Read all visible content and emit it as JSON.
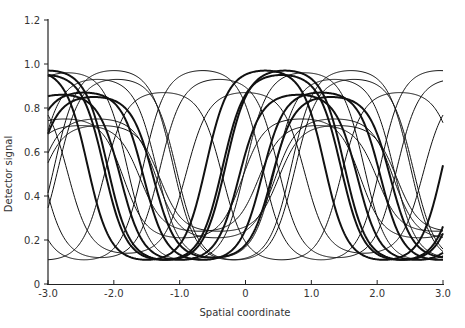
{
  "chart_data": {
    "type": "line",
    "title": "",
    "xlabel": "Spatial coordinate",
    "ylabel": "Detector signal",
    "xlim": [
      -3.0,
      3.0
    ],
    "ylim": [
      0,
      1.2
    ],
    "grid": false,
    "legend": "none",
    "x_ticks": [
      -3.0,
      -2.0,
      -1.0,
      0,
      1.0,
      2.0,
      3.0
    ],
    "x_tick_labels": [
      "-3.0",
      "-2.0",
      "-1.0",
      "0",
      "1.0",
      "2.0",
      "3.0"
    ],
    "y_ticks": [
      0,
      0.2,
      0.4,
      0.6,
      0.8,
      1.0,
      1.2
    ],
    "y_tick_labels": [
      "0",
      "0.2",
      "0.4",
      "0.6",
      "0.8",
      "1.0",
      "1.2"
    ],
    "period": 3.6,
    "series": [
      {
        "name": "curve-1",
        "peak_x": -2.45,
        "max": 0.87,
        "min": 0.11,
        "weight": "thick"
      },
      {
        "name": "curve-2",
        "peak_x": -2.3,
        "max": 0.85,
        "min": 0.12,
        "weight": "thick"
      },
      {
        "name": "curve-3",
        "peak_x": -3.0,
        "max": 0.97,
        "min": 0.11,
        "weight": "thick"
      },
      {
        "name": "curve-4",
        "peak_x": -2.7,
        "max": 0.96,
        "min": 0.11,
        "weight": "thin"
      },
      {
        "name": "curve-5",
        "peak_x": -2.25,
        "max": 0.75,
        "min": 0.21,
        "weight": "thin"
      },
      {
        "name": "curve-6",
        "peak_x": -2.2,
        "max": 0.72,
        "min": 0.24,
        "weight": "thin"
      },
      {
        "name": "curve-7",
        "peak_x": -1.95,
        "max": 0.93,
        "min": 0.11,
        "weight": "thin"
      },
      {
        "name": "curve-8",
        "peak_x": -0.65,
        "max": 0.97,
        "min": 0.11,
        "weight": "thin"
      },
      {
        "name": "curve-9",
        "peak_x": -0.4,
        "max": 0.93,
        "min": 0.12,
        "weight": "thin"
      },
      {
        "name": "curve-10",
        "peak_x": 0.0,
        "max": 0.87,
        "min": 0.14,
        "weight": "thin"
      },
      {
        "name": "curve-11",
        "peak_x": 0.3,
        "max": 0.97,
        "min": 0.11,
        "weight": "thick"
      },
      {
        "name": "curve-12",
        "peak_x": 0.55,
        "max": 0.95,
        "min": 0.11,
        "weight": "thick"
      },
      {
        "name": "curve-13",
        "peak_x": 0.85,
        "max": 0.75,
        "min": 0.21,
        "weight": "thin"
      },
      {
        "name": "curve-14",
        "peak_x": 1.1,
        "max": 0.72,
        "min": 0.24,
        "weight": "thin"
      },
      {
        "name": "curve-15",
        "peak_x": 1.35,
        "max": 0.93,
        "min": 0.12,
        "weight": "thin"
      },
      {
        "name": "curve-16",
        "peak_x": 1.6,
        "max": 0.97,
        "min": 0.11,
        "weight": "thin"
      },
      {
        "name": "curve-17",
        "peak_x": -1.25,
        "max": 0.87,
        "min": 0.11,
        "weight": "thin"
      },
      {
        "name": "curve-18",
        "peak_x": 0.8,
        "max": 0.86,
        "min": 0.11,
        "weight": "thick"
      }
    ]
  }
}
